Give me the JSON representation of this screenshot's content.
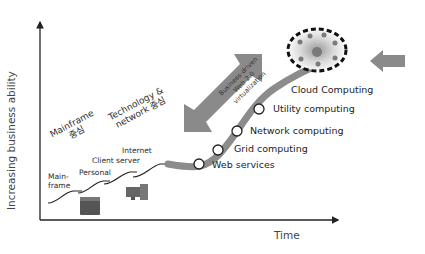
{
  "axes": {
    "y_label": "Increasing business ability",
    "x_label": "Time"
  },
  "eras": [
    {
      "label": "Mainframe",
      "sub": "중심"
    },
    {
      "label": "Technology &",
      "sub": "network 중심"
    }
  ],
  "early_steps": [
    {
      "label": "Main-",
      "label2": "frame"
    },
    {
      "label": "Personal"
    },
    {
      "label": "Client server"
    },
    {
      "label": "Internet"
    }
  ],
  "arrow_text": {
    "line1": "Business-driven",
    "line2": "Web 2.0",
    "line3": "virtualization"
  },
  "stages": [
    {
      "label": "Web services"
    },
    {
      "label": "Grid computing"
    },
    {
      "label": "Network computing"
    },
    {
      "label": "Utility computing"
    },
    {
      "label": "Cloud Computing"
    }
  ],
  "colors": {
    "curve": "#8c8c8c",
    "big_arrow": "#8a8a8a",
    "axis": "#222222",
    "node_fill": "#ffffff",
    "node_stroke": "#222222"
  }
}
